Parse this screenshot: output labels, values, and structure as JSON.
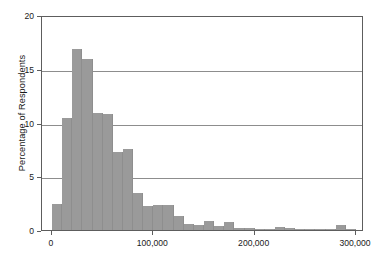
{
  "chart_data": {
    "type": "bar",
    "title": "",
    "subtitle": "",
    "xlabel": "",
    "ylabel": "Percentage of Respondents",
    "xlim": [
      0,
      300000
    ],
    "ylim": [
      0,
      20
    ],
    "bin_width": 10000,
    "grid": "horizontal",
    "legend": "none",
    "bar_color": "#9a9a9a",
    "axis_color": "#5d5d5d",
    "x_tick_labels": [
      "0",
      "100,000",
      "200,000",
      "300,000"
    ],
    "x_tick_values": [
      0,
      100000,
      200000,
      300000
    ],
    "y_tick_labels": [
      "0",
      "5",
      "10",
      "15",
      "20"
    ],
    "y_tick_values": [
      0,
      5,
      10,
      15,
      20
    ],
    "categories": [
      "0-10,000",
      "10,000-20,000",
      "20,000-30,000",
      "30,000-40,000",
      "40,000-50,000",
      "50,000-60,000",
      "60,000-70,000",
      "70,000-80,000",
      "80,000-90,000",
      "90,000-100,000",
      "100,000-110,000",
      "110,000-120,000",
      "120,000-130,000",
      "130,000-140,000",
      "140,000-150,000",
      "150,000-160,000",
      "160,000-170,000",
      "170,000-180,000",
      "180,000-190,000",
      "190,000-200,000",
      "200,000-210,000",
      "210,000-220,000",
      "220,000-230,000",
      "230,000-240,000",
      "240,000-250,000",
      "250,000-260,000",
      "260,000-270,000",
      "270,000-280,000",
      "280,000-290,000",
      "290,000-300,000"
    ],
    "x": [
      0,
      10000,
      20000,
      30000,
      40000,
      50000,
      60000,
      70000,
      80000,
      90000,
      100000,
      110000,
      120000,
      130000,
      140000,
      150000,
      160000,
      170000,
      180000,
      190000,
      200000,
      210000,
      220000,
      230000,
      240000,
      250000,
      260000,
      270000,
      280000,
      290000
    ],
    "values": [
      2.4,
      10.4,
      16.8,
      15.9,
      10.9,
      10.8,
      7.3,
      7.5,
      3.4,
      2.2,
      2.3,
      2.3,
      1.3,
      0.6,
      0.5,
      0.8,
      0.35,
      0.7,
      0.2,
      0.2,
      0.1,
      0.05,
      0.25,
      0.2,
      0.05,
      0.1,
      0.05,
      0.05,
      0.45,
      0.05
    ]
  },
  "axes": {
    "y_title": "Percentage of Respondents"
  }
}
